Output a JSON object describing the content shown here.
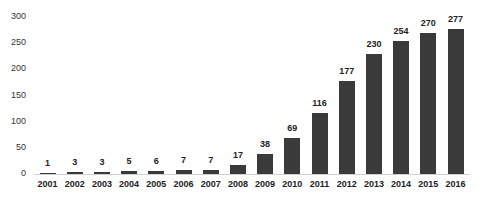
{
  "chart_data": {
    "type": "bar",
    "title": "",
    "xlabel": "",
    "ylabel": "",
    "categories": [
      "2001",
      "2002",
      "2003",
      "2004",
      "2005",
      "2006",
      "2007",
      "2008",
      "2009",
      "2010",
      "2011",
      "2012",
      "2013",
      "2014",
      "2015",
      "2016"
    ],
    "values": [
      1,
      3,
      3,
      5,
      6,
      7,
      7,
      17,
      38,
      69,
      116,
      177,
      230,
      254,
      270,
      277
    ],
    "data_labels": [
      "1",
      "3",
      "3",
      "5",
      "6",
      "7",
      "7",
      "17",
      "38",
      "69",
      "116",
      "177",
      "230",
      "254",
      "270",
      "277"
    ],
    "yticks": [
      "0",
      "50",
      "100",
      "150",
      "200",
      "250",
      "300"
    ],
    "ylim": [
      0,
      300
    ],
    "grid": false,
    "legend": null,
    "bar_color": "#3a3a3a"
  }
}
